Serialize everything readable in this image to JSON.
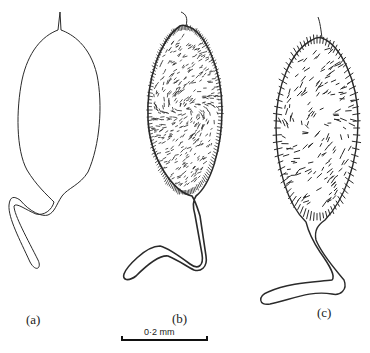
{
  "figure": {
    "panels": [
      {
        "id": "a",
        "label": "(a)",
        "style": "outline"
      },
      {
        "id": "b",
        "label": "(b)",
        "style": "dense-hairs"
      },
      {
        "id": "c",
        "label": "(c)",
        "style": "sparse-spines"
      }
    ],
    "scale_bar": {
      "label": "0·2 mm"
    },
    "colors": {
      "ink": "#2a2a2a",
      "background": "#ffffff"
    }
  }
}
